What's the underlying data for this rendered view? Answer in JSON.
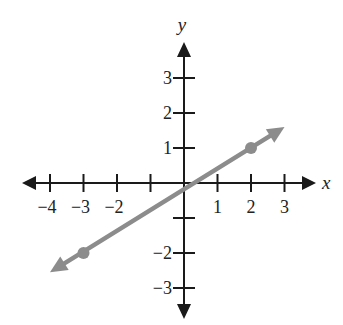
{
  "chart_data": {
    "type": "line",
    "title": "",
    "xlabel": "x",
    "ylabel": "y",
    "xlim": [
      -4,
      3
    ],
    "ylim": [
      -3,
      3
    ],
    "grid": false,
    "x_ticks": [
      -4,
      -3,
      -2,
      -1,
      0,
      1,
      2,
      3
    ],
    "x_tick_labels": [
      "−4",
      "−3",
      "−2",
      "",
      "",
      "1",
      "2",
      "3"
    ],
    "y_ticks": [
      -3,
      -2,
      -1,
      0,
      1,
      2,
      3
    ],
    "y_tick_labels": [
      "−3",
      "−2",
      "",
      "",
      "1",
      "2",
      "3"
    ],
    "series": [
      {
        "name": "line",
        "equation": "y = 0.6x + 0.2",
        "slope": 0.6,
        "intercept": 0.2,
        "marked_points": [
          {
            "x": -3,
            "y": -2
          },
          {
            "x": 2,
            "y": 1
          }
        ],
        "arrow_ends": [
          {
            "x": -4.0,
            "y": -2.55
          },
          {
            "x": 3.0,
            "y": 1.6
          }
        ],
        "color": "#8c8c8c"
      }
    ],
    "axis_color": "#1a1a1a"
  }
}
